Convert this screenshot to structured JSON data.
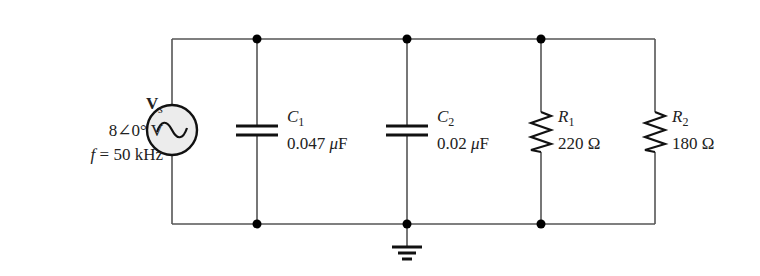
{
  "source": {
    "name": "V",
    "subscript": "s",
    "value": "8∠0° V",
    "frequency": "f = 50 kHz",
    "icon": "ac-source-icon"
  },
  "components": [
    {
      "id": "C1",
      "type": "capacitor",
      "name": "C",
      "subscript": "1",
      "value": "0.047 μF"
    },
    {
      "id": "C2",
      "type": "capacitor",
      "name": "C",
      "subscript": "2",
      "value": "0.02 μF"
    },
    {
      "id": "R1",
      "type": "resistor",
      "name": "R",
      "subscript": "1",
      "value": "220 Ω"
    },
    {
      "id": "R2",
      "type": "resistor",
      "name": "R",
      "subscript": "2",
      "value": "180 Ω"
    }
  ],
  "ground": {
    "icon": "ground-icon"
  },
  "colors": {
    "wire": "#555555",
    "component": "#111111",
    "source_fill": "#ececec"
  }
}
